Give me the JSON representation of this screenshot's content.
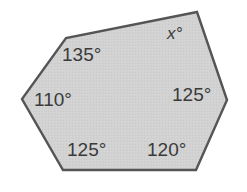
{
  "figure": {
    "name": "irregular-hexagon-interior-angles",
    "shape_type": "hexagon",
    "fill_color": "#d2d2d2",
    "stroke_color": "#555555",
    "stroke_width": 2,
    "background_color": "#ffffff",
    "text_color": "#3a3a3a",
    "vertices": [
      {
        "name": "top-right",
        "x": 197,
        "y": 12
      },
      {
        "name": "top-left",
        "x": 66,
        "y": 38
      },
      {
        "name": "left",
        "x": 22,
        "y": 99
      },
      {
        "name": "bottom-left",
        "x": 63,
        "y": 170
      },
      {
        "name": "bottom-right",
        "x": 196,
        "y": 170
      },
      {
        "name": "right",
        "x": 227,
        "y": 100
      }
    ],
    "angles": [
      {
        "id": "angle-x",
        "vertex": "top-right",
        "value": "x",
        "label": "x°",
        "known": false
      },
      {
        "id": "angle-top-left",
        "vertex": "top-left",
        "value": "135",
        "label": "135°",
        "known": true
      },
      {
        "id": "angle-left",
        "vertex": "left",
        "value": "110",
        "label": "110°",
        "known": true
      },
      {
        "id": "angle-bottom-left",
        "vertex": "bottom-left",
        "value": "125",
        "label": "125°",
        "known": true
      },
      {
        "id": "angle-bottom-right",
        "vertex": "bottom-right",
        "value": "120",
        "label": "120°",
        "known": true
      },
      {
        "id": "angle-right",
        "vertex": "right",
        "value": "125",
        "label": "125°",
        "known": true
      }
    ]
  }
}
